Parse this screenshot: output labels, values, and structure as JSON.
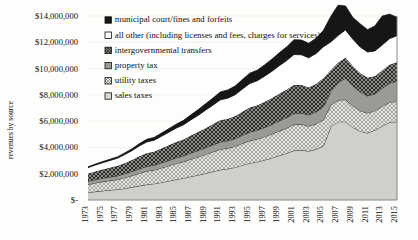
{
  "chart_data": {
    "type": "area",
    "stacked": true,
    "title": "",
    "xlabel": "",
    "ylabel": "revenues by source",
    "ylim": [
      0,
      14000000
    ],
    "ytick_labels": [
      "$14,000,000",
      "$12,000,000",
      "$10,000,000",
      "$8,000,000",
      "$6,000,000",
      "$4,000,000",
      "$2,000,000",
      "$-"
    ],
    "ytick_values": [
      14000000,
      12000000,
      10000000,
      8000000,
      6000000,
      4000000,
      2000000,
      0
    ],
    "grid": true,
    "legend_position": "top-center",
    "x": [
      1973,
      1974,
      1975,
      1976,
      1977,
      1978,
      1979,
      1980,
      1981,
      1982,
      1983,
      1984,
      1985,
      1986,
      1987,
      1988,
      1989,
      1990,
      1991,
      1992,
      1993,
      1994,
      1995,
      1996,
      1997,
      1998,
      1999,
      2000,
      2001,
      2002,
      2003,
      2004,
      2005,
      2006,
      2007,
      2008,
      2009,
      2010,
      2011,
      2012,
      2013,
      2014,
      2015
    ],
    "xtick_labels": [
      "1973",
      "1975",
      "1977",
      "1979",
      "1981",
      "1983",
      "1985",
      "1987",
      "1989",
      "1991",
      "1993",
      "1995",
      "1997",
      "1999",
      "2001",
      "2003",
      "2005",
      "2007",
      "2009",
      "2011",
      "2013",
      "2015"
    ],
    "series": [
      {
        "name": "sales taxes",
        "pattern": "solid-light-gray",
        "color": "#cfcfcb",
        "values": [
          560000,
          640000,
          700000,
          760000,
          800000,
          880000,
          980000,
          1080000,
          1180000,
          1240000,
          1340000,
          1450000,
          1560000,
          1660000,
          1790000,
          1900000,
          2030000,
          2170000,
          2300000,
          2380000,
          2480000,
          2650000,
          2800000,
          2900000,
          3040000,
          3200000,
          3380000,
          3560000,
          3760000,
          3800000,
          3720000,
          3860000,
          4120000,
          5560000,
          5960000,
          5960000,
          5520000,
          5240000,
          5100000,
          5320000,
          5620000,
          5920000,
          5960000
        ]
      },
      {
        "name": "utility taxes",
        "pattern": "crosshatch-light",
        "color": "#dedeDB",
        "values": [
          620000,
          660000,
          700000,
          720000,
          760000,
          820000,
          880000,
          960000,
          1020000,
          1040000,
          1100000,
          1160000,
          1220000,
          1260000,
          1320000,
          1380000,
          1440000,
          1500000,
          1560000,
          1560000,
          1600000,
          1660000,
          1720000,
          1740000,
          1780000,
          1820000,
          1880000,
          1920000,
          1980000,
          1960000,
          1900000,
          1940000,
          2000000,
          1660000,
          1640000,
          1680000,
          1620000,
          1560000,
          1520000,
          1480000,
          1500000,
          1520000,
          1540000
        ]
      },
      {
        "name": "property tax",
        "pattern": "solid-medium-gray",
        "color": "#9a9a97",
        "values": [
          240000,
          250000,
          260000,
          270000,
          280000,
          300000,
          320000,
          340000,
          360000,
          370000,
          390000,
          410000,
          430000,
          450000,
          470000,
          490000,
          510000,
          530000,
          560000,
          570000,
          590000,
          620000,
          650000,
          670000,
          700000,
          730000,
          760000,
          790000,
          830000,
          850000,
          860000,
          900000,
          960000,
          1060000,
          1320000,
          1640000,
          1560000,
          1420000,
          1300000,
          1280000,
          1380000,
          1460000,
          1540000
        ]
      },
      {
        "name": "intergovernmental transfers",
        "pattern": "crosshatch-dark",
        "color": "#6e6e6b",
        "values": [
          580000,
          620000,
          660000,
          700000,
          740000,
          800000,
          860000,
          940000,
          1000000,
          1020000,
          1080000,
          1140000,
          1200000,
          1240000,
          1320000,
          1400000,
          1480000,
          1560000,
          1640000,
          1660000,
          1700000,
          1780000,
          1860000,
          1880000,
          1940000,
          2000000,
          2060000,
          2120000,
          2180000,
          2140000,
          2080000,
          2120000,
          2180000,
          1600000,
          1520000,
          1540000,
          1480000,
          1420000,
          1380000,
          1340000,
          1360000,
          1400000,
          1440000
        ]
      },
      {
        "name": "all other (including licenses and fees, charges for services)",
        "pattern": "white",
        "color": "#ffffff",
        "values": [
          460000,
          490000,
          520000,
          560000,
          600000,
          660000,
          720000,
          800000,
          860000,
          880000,
          940000,
          1000000,
          1060000,
          1120000,
          1200000,
          1280000,
          1380000,
          1460000,
          1560000,
          1580000,
          1640000,
          1740000,
          1840000,
          1880000,
          1960000,
          2040000,
          2140000,
          2220000,
          2320000,
          2300000,
          2260000,
          2320000,
          2400000,
          2140000,
          2080000,
          2120000,
          2060000,
          2000000,
          1960000,
          1920000,
          1940000,
          1980000,
          2020000
        ]
      },
      {
        "name": "municipal court/fines and forfeits",
        "pattern": "solid-black",
        "color": "#161616",
        "values": [
          60000,
          70000,
          80000,
          90000,
          100000,
          120000,
          140000,
          170000,
          200000,
          210000,
          240000,
          270000,
          300000,
          330000,
          380000,
          430000,
          490000,
          540000,
          600000,
          620000,
          660000,
          720000,
          780000,
          800000,
          860000,
          920000,
          980000,
          1040000,
          1120000,
          1120000,
          1100000,
          1160000,
          1240000,
          1940000,
          2300000,
          1820000,
          1640000,
          1760000,
          1700000,
          1900000,
          2200000,
          1860000,
          1400000
        ]
      }
    ]
  }
}
